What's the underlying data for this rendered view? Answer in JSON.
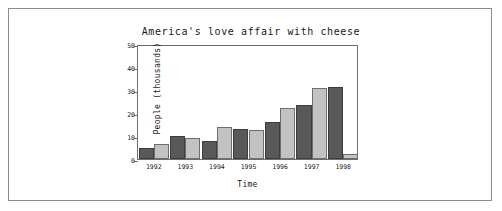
{
  "chart_data": {
    "type": "bar",
    "title": "America's love affair with cheese",
    "xlabel": "Time",
    "ylabel": "People (thousands)",
    "categories": [
      "1992",
      "1993",
      "1994",
      "1995",
      "1996",
      "1997",
      "1998"
    ],
    "series": [
      {
        "name": "series-1",
        "color": "#595959",
        "values": [
          5,
          10,
          8,
          13,
          16,
          23.5,
          31.5
        ]
      },
      {
        "name": "series-2",
        "color": "#c2c2c2",
        "values": [
          6.5,
          9,
          14,
          12.5,
          22,
          31,
          2
        ]
      }
    ],
    "ylim": [
      0,
      50
    ],
    "yticks": [
      0,
      10,
      20,
      30,
      40,
      50
    ],
    "ytick_labels": [
      "0",
      "10",
      "20",
      "30",
      "40",
      "50"
    ],
    "grid": false,
    "legend": "none"
  },
  "figure": {
    "border_color": "#8c8c8c",
    "background": "#ffffff",
    "axis_color": "#6e6e6e"
  }
}
